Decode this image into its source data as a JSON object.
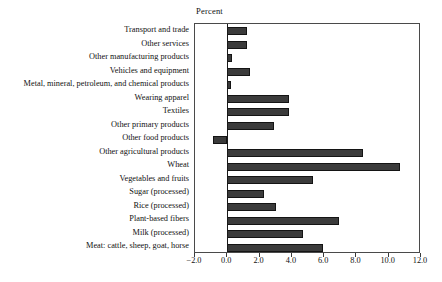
{
  "chart_data": {
    "type": "bar",
    "orientation": "horizontal",
    "title": "Percent",
    "xlabel": "Percent",
    "ylabel": "",
    "xlim": [
      -2.0,
      12.0
    ],
    "xticks": [
      "-2.0",
      "0.0",
      "2.0",
      "4.0",
      "6.0",
      "8.0",
      "10.0",
      "12.0"
    ],
    "xtick_values": [
      -2.0,
      0.0,
      2.0,
      4.0,
      6.0,
      8.0,
      10.0,
      12.0
    ],
    "grid": false,
    "legend": null,
    "bar_color": "#3b3b3b",
    "bar_edge_color": "#141414",
    "categories": [
      "Transport and trade",
      "Other services",
      "Other manufacturing products",
      "Vehicles and equipment",
      "Metal, mineral, petroleum, and chemical products",
      "Wearing apparel",
      "Textiles",
      "Other primary products",
      "Other food products",
      "Other agricultural products",
      "Wheat",
      "Vegetables and fruits",
      "Sugar (processed)",
      "Rice (processed)",
      "Plant-based fibers",
      "Milk (processed)",
      "Meat: cattle, sheep, goat, horse"
    ],
    "values": [
      1.2,
      1.2,
      0.3,
      1.4,
      0.25,
      3.8,
      3.8,
      2.9,
      -0.9,
      8.4,
      10.7,
      5.3,
      2.3,
      3.0,
      6.9,
      4.7,
      5.9
    ]
  }
}
